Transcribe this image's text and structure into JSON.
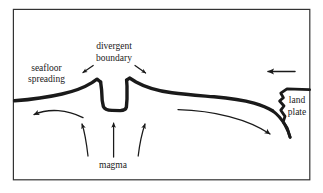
{
  "figure": {
    "kind": "cross-section-diagram",
    "background_color": "#ffffff",
    "frame": {
      "border_color": "#333333",
      "border_width_px": 1.2,
      "x": 13,
      "y": 9,
      "width": 297,
      "height": 171
    },
    "ink_color": "#1a1a1a"
  },
  "labels": {
    "seafloor_spreading_line1": "seafloor",
    "seafloor_spreading_line2": "spreading",
    "divergent_boundary_line1": "divergent",
    "divergent_boundary_line2": "boundary",
    "land_plate_line1": "land",
    "land_plate_line2": "plate",
    "magma": "magma"
  },
  "features": {
    "seafloor_crust": {
      "name": "oceanic-crust-profile",
      "stroke_width": 3.4
    },
    "rift_valley": {
      "name": "central-rift-valley",
      "description": "U-shaped trough between two raised ridge crests"
    },
    "land_plate_edge": {
      "name": "continental-plate-edge",
      "description": "jagged subduction trench at right margin"
    }
  },
  "arrows": {
    "magma_upwelling": [
      {
        "name": "magma-arrow-left",
        "direction": "up-left"
      },
      {
        "name": "magma-arrow-center",
        "direction": "up"
      },
      {
        "name": "magma-arrow-right",
        "direction": "up-right"
      }
    ],
    "divergence_pointers": [
      {
        "name": "divergent-pointer-left",
        "direction": "down-left"
      },
      {
        "name": "divergent-pointer-right",
        "direction": "down-right"
      }
    ],
    "plate_motion": [
      {
        "name": "spreading-arrow-left",
        "direction": "left"
      },
      {
        "name": "spreading-arrow-right",
        "direction": "right-down"
      },
      {
        "name": "land-plate-arrow",
        "direction": "left"
      }
    ]
  }
}
